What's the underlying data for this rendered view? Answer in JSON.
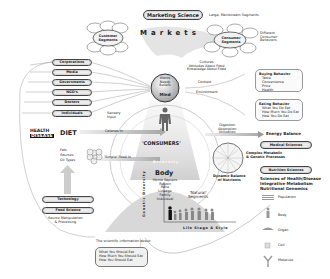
{
  "top": {
    "marketing_science": "Marketing Science",
    "large_segments_note": "Large, Mainstream Segments",
    "markets": "Markets",
    "customer_segments_left": "Customer Segments",
    "consumer_segments_right": "Consumer Segments",
    "different_behaviors": [
      "Different",
      "Consumer",
      "Behaviors"
    ]
  },
  "influencers": {
    "items": [
      "Corporations",
      "Media",
      "Governments",
      "NGO's",
      "Doctors",
      "Individuals"
    ]
  },
  "mind": {
    "lines": [
      "Wants",
      "Needs",
      "Beliefs"
    ],
    "title": "Mind",
    "context_items": [
      "Cultures",
      "Attitudes About Food",
      "Knowledge About Food"
    ],
    "context": "Context",
    "environment": "Environment",
    "sensory_input": [
      "Sensory",
      "Input"
    ]
  },
  "behaviors": {
    "buying": {
      "title": "Buying Behavior",
      "items": [
        "Taste",
        "Convenience",
        "Price",
        "Health"
      ]
    },
    "eating": {
      "title": "Eating Behavior",
      "items": [
        "What You Do Eat",
        "How Much You Do Eat",
        "How You Do Eat"
      ]
    }
  },
  "diet": {
    "health": "HEALTH",
    "disease": "DISEASE",
    "diet": "DIET",
    "calories_in": "Calories In",
    "fats_sources": [
      "Fats",
      "Sources",
      "Oil Types"
    ],
    "simple_food": "'Simple' Food In",
    "digestion": [
      "Digestion",
      "Absorption",
      "Utilization"
    ],
    "energy_balance": "Energy Balance"
  },
  "center": {
    "consumers": "'CONSUMERS'",
    "diversity": "Diversity",
    "body": "Body",
    "body_items": [
      "Homo Sapiens",
      "Region",
      "Race",
      "Lineage",
      "Family",
      "Individual"
    ],
    "natural_segments": [
      "'Natural'",
      "Segments"
    ],
    "genetic_diversity": "Genetic Diversity",
    "life_stage": "Life Stage & Style",
    "dynamic_balance": [
      "Dynamic Balance",
      "of Nutrients"
    ]
  },
  "right": {
    "medical_sciences": "Medical Sciences",
    "complex_metabolic": [
      "Complex Metabolic",
      "& Genetic Processes"
    ],
    "nutrition_sciences": "Nutrition Sciences",
    "sciences_lines": [
      "Sciences of Health/Disease",
      "Integrative Metabolism",
      "Nutritional Genomics"
    ],
    "scale": [
      "Population",
      "Body",
      "Organ",
      "Cell",
      "Molecule"
    ]
  },
  "bottom_left": {
    "technology": "Technology",
    "food_science": "Food Science",
    "source_manip": [
      "Source Manipulation",
      "& Processing"
    ],
    "scientific_info": "The scientific information about:",
    "should": [
      "What You Should Eat",
      "How Much You Should Eat",
      "How You Should Eat"
    ]
  }
}
